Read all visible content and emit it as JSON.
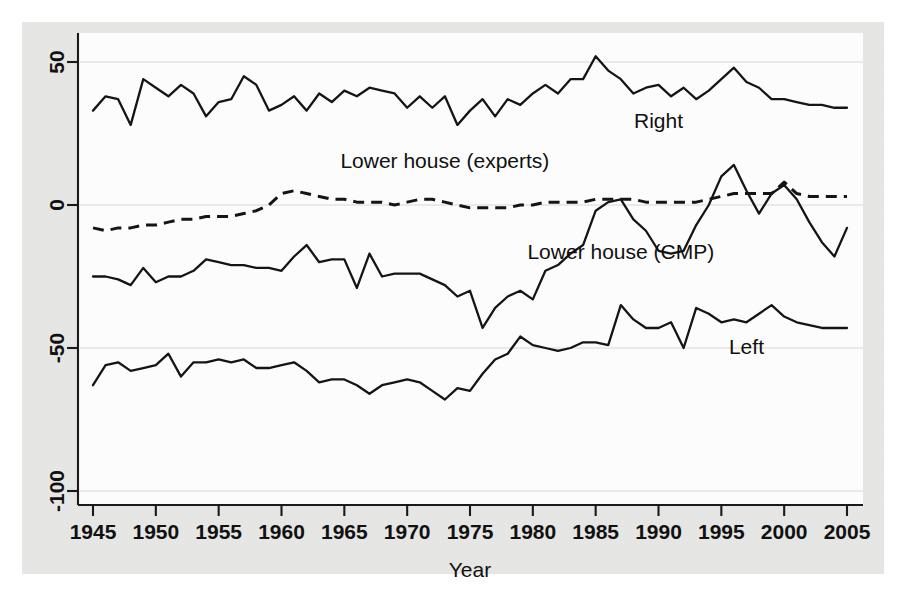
{
  "chart_data": {
    "type": "line",
    "title": "",
    "xlabel": "Year",
    "ylabel": "",
    "xlim": [
      1945,
      2005
    ],
    "ylim": [
      -100,
      60
    ],
    "grid": true,
    "legend_position": "inline-annotations",
    "xticks": [
      1945,
      1950,
      1955,
      1960,
      1965,
      1970,
      1975,
      1980,
      1985,
      1990,
      1995,
      2000,
      2005
    ],
    "xtick_labels": [
      "1945",
      "1950",
      "1955",
      "1960",
      "1965",
      "1970",
      "1975",
      "1980",
      "1985",
      "1990",
      "1995",
      "2000",
      "2005"
    ],
    "yticks": [
      50,
      0,
      -50,
      -100
    ],
    "ytick_labels": [
      "50",
      "0",
      "-50",
      "-100"
    ],
    "x": [
      1945,
      1946,
      1947,
      1948,
      1949,
      1950,
      1951,
      1952,
      1953,
      1954,
      1955,
      1956,
      1957,
      1958,
      1959,
      1960,
      1961,
      1962,
      1963,
      1964,
      1965,
      1966,
      1967,
      1968,
      1969,
      1970,
      1971,
      1972,
      1973,
      1974,
      1975,
      1976,
      1977,
      1978,
      1979,
      1980,
      1981,
      1982,
      1983,
      1984,
      1985,
      1986,
      1987,
      1988,
      1989,
      1990,
      1991,
      1992,
      1993,
      1994,
      1995,
      1996,
      1997,
      1998,
      1999,
      2000,
      2001,
      2002,
      2003,
      2004,
      2005
    ],
    "series": [
      {
        "name": "Right",
        "style": "solid",
        "label_text": "Right",
        "label_x": 1990,
        "label_y": 27,
        "values": [
          33,
          38,
          37,
          28,
          44,
          41,
          38,
          42,
          39,
          31,
          36,
          37,
          45,
          42,
          33,
          35,
          38,
          33,
          39,
          36,
          40,
          38,
          41,
          40,
          39,
          34,
          38,
          34,
          38,
          28,
          33,
          37,
          31,
          37,
          35,
          39,
          42,
          39,
          44,
          44,
          52,
          47,
          44,
          39,
          41,
          42,
          38,
          41,
          37,
          40,
          44,
          48,
          43,
          41,
          37,
          37,
          36,
          35,
          35,
          34,
          34
        ]
      },
      {
        "name": "Lower house (experts)",
        "style": "dashed",
        "label_text": "Lower house (experts)",
        "label_x": 1973,
        "label_y": 13,
        "values": [
          -8,
          -9,
          -8,
          -8,
          -7,
          -7,
          -6,
          -5,
          -5,
          -4,
          -4,
          -4,
          -3,
          -2,
          0,
          4,
          5,
          4,
          3,
          2,
          2,
          1,
          1,
          1,
          0,
          1,
          2,
          2,
          1,
          0,
          -1,
          -1,
          -1,
          -1,
          0,
          0,
          1,
          1,
          1,
          1,
          2,
          2,
          2,
          2,
          1,
          1,
          1,
          1,
          1,
          2,
          3,
          4,
          4,
          4,
          4,
          8,
          4,
          3,
          3,
          3,
          3
        ]
      },
      {
        "name": "Lower house (CMP)",
        "style": "solid",
        "label_text": "Lower house (CMP)",
        "label_x": 1987,
        "label_y": -19,
        "values": [
          -25,
          -25,
          -26,
          -28,
          -22,
          -27,
          -25,
          -25,
          -23,
          -19,
          -20,
          -21,
          -21,
          -22,
          -22,
          -23,
          -18,
          -14,
          -20,
          -19,
          -19,
          -29,
          -17,
          -25,
          -24,
          -24,
          -24,
          -26,
          -28,
          -32,
          -30,
          -43,
          -36,
          -32,
          -30,
          -33,
          -23,
          -21,
          -17,
          -14,
          -2,
          1,
          2,
          -5,
          -9,
          -16,
          -17,
          -16,
          -7,
          0,
          10,
          14,
          5,
          -3,
          4,
          7,
          2,
          -6,
          -13,
          -18,
          -8
        ]
      },
      {
        "name": "Left",
        "style": "solid",
        "label_text": "Left",
        "label_x": 1997,
        "label_y": -52,
        "values": [
          -63,
          -56,
          -55,
          -58,
          -57,
          -56,
          -52,
          -60,
          -55,
          -55,
          -54,
          -55,
          -54,
          -57,
          -57,
          -56,
          -55,
          -58,
          -62,
          -61,
          -61,
          -63,
          -66,
          -63,
          -62,
          -61,
          -62,
          -65,
          -68,
          -64,
          -65,
          -59,
          -54,
          -52,
          -46,
          -49,
          -50,
          -51,
          -50,
          -48,
          -48,
          -49,
          -35,
          -40,
          -43,
          -43,
          -41,
          -50,
          -36,
          -38,
          -41,
          -40,
          -41,
          -38,
          -35,
          -39,
          -41,
          -42,
          -43,
          -43,
          -43
        ]
      }
    ]
  }
}
